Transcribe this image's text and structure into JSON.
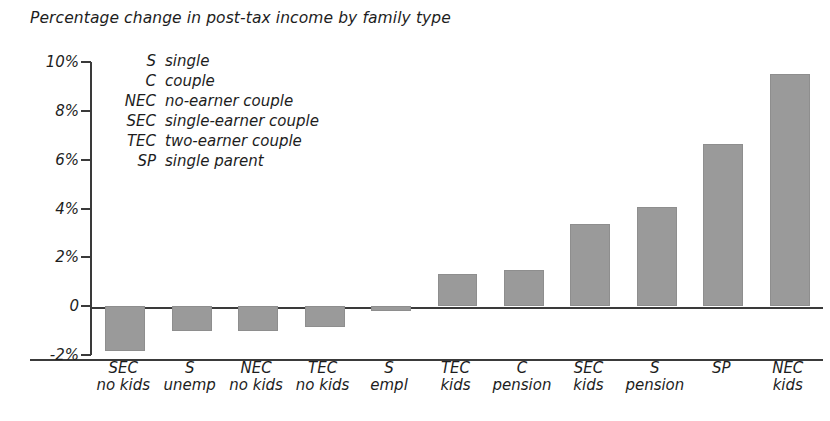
{
  "chart_data": {
    "type": "bar",
    "title": "Percentage change in post-tax income by family type",
    "xlabel": "",
    "ylabel": "",
    "ylim": [
      -2,
      10
    ],
    "grid": false,
    "legend_position": "inside-top-left",
    "categories": [
      "SEC no kids",
      "S unemp",
      "NEC no kids",
      "TEC no kids",
      "S empl",
      "TEC kids",
      "C pension",
      "SEC kids",
      "S pension",
      "SP",
      "NEC kids"
    ],
    "category_lines": [
      {
        "line1": "SEC",
        "line2": "no kids"
      },
      {
        "line1": "S",
        "line2": "unemp"
      },
      {
        "line1": "NEC",
        "line2": "no kids"
      },
      {
        "line1": "TEC",
        "line2": "no kids"
      },
      {
        "line1": "S",
        "line2": "empl"
      },
      {
        "line1": "TEC",
        "line2": "kids"
      },
      {
        "line1": "C",
        "line2": "pension"
      },
      {
        "line1": "SEC",
        "line2": "kids"
      },
      {
        "line1": "S",
        "line2": "pension"
      },
      {
        "line1": "SP",
        "line2": ""
      },
      {
        "line1": "NEC",
        "line2": "kids"
      }
    ],
    "values": [
      -1.85,
      -1.0,
      -1.0,
      -0.85,
      -0.2,
      1.3,
      1.5,
      3.35,
      4.05,
      6.65,
      9.5
    ],
    "ytick_values": [
      10,
      8,
      6,
      4,
      2,
      0,
      -2
    ],
    "ytick_labels": [
      "10%",
      "8%",
      "6%",
      "4%",
      "2%",
      "0",
      "-2%"
    ],
    "bar_color": "#9a9a9a",
    "axis_color": "#3a3a3a"
  },
  "legend": {
    "entries": [
      {
        "abbr": "S",
        "desc": "single"
      },
      {
        "abbr": "C",
        "desc": "couple"
      },
      {
        "abbr": "NEC",
        "desc": "no-earner couple"
      },
      {
        "abbr": "SEC",
        "desc": "single-earner couple"
      },
      {
        "abbr": "TEC",
        "desc": "two-earner couple"
      },
      {
        "abbr": "SP",
        "desc": "single parent"
      }
    ]
  }
}
